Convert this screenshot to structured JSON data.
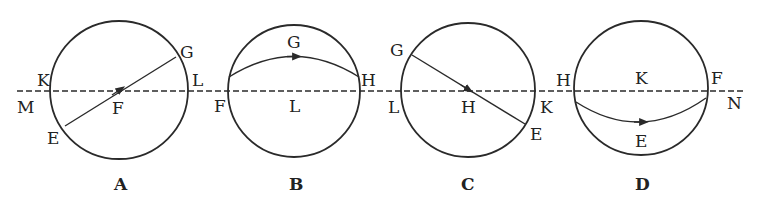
{
  "figure": {
    "colors": {
      "stroke": "#2a2a2a",
      "background": "#ffffff",
      "text": "#222222"
    },
    "axis_line": {
      "style": "dashed",
      "left_label": "M",
      "right_label": "N"
    },
    "panels": [
      {
        "caption": "A",
        "path_type": "straight chord through center with arrow at center",
        "labels": {
          "top_right": "G",
          "left": "K",
          "right": "L",
          "center": "F",
          "bottom_left": "E"
        }
      },
      {
        "caption": "B",
        "path_type": "arc above axis with arrow pointing right",
        "labels": {
          "arc": "G",
          "left": "F",
          "right": "H",
          "center_below": "L"
        }
      },
      {
        "caption": "C",
        "path_type": "straight chord through center with arrow at center",
        "labels": {
          "top_left": "G",
          "left": "L",
          "right": "K",
          "center": "H",
          "bottom_right": "E"
        }
      },
      {
        "caption": "D",
        "path_type": "arc below axis with arrow pointing right",
        "labels": {
          "left": "H",
          "center_above": "K",
          "right": "F",
          "arc": "E"
        }
      }
    ],
    "between_labels": {
      "a_b_left": "L",
      "b_c_between": "L",
      "c_d_between": "H"
    }
  }
}
